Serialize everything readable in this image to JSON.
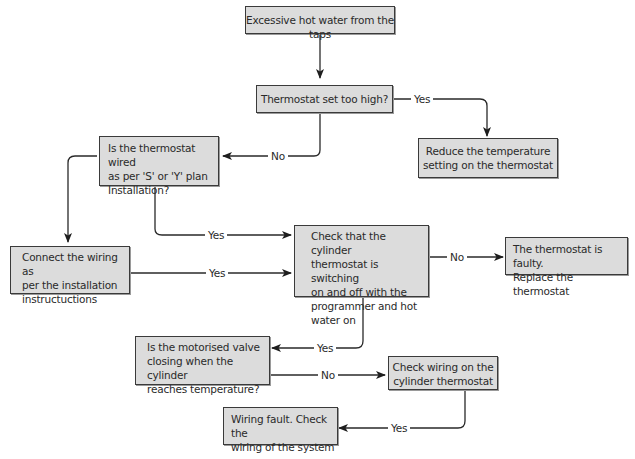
{
  "diagram": {
    "type": "flowchart",
    "nodes": {
      "start": "Excessive hot water from the taps",
      "thermostat_high": "Thermostat set too high?",
      "reduce_temp": "Reduce the temperature setting on the thermostat",
      "wired_plan": "Is the thermostat wired as per 'S' or 'Y' plan Installation?",
      "connect_wiring": "Connect the wiring as per the installation instructions",
      "check_switching": "Check that the cylinder thermostat is switching on and off with the programmer and hot water on",
      "faulty": "The thermostat is faulty. Replace the thermostat",
      "motorised_valve": "Is the motorised valve closing when the cylinder reaches temperature?",
      "check_wiring": "Check wiring on the cylinder thermostat",
      "wiring_fault": "Wiring fault. Check the wiring of the system"
    },
    "node_lines": {
      "start": [
        "Excessive hot water from the taps"
      ],
      "thermostat_high": [
        "Thermostat set too high?"
      ],
      "reduce_temp": [
        "Reduce the temperature",
        "setting on the thermostat"
      ],
      "wired_plan": [
        "Is the thermostat wired",
        "as per 'S' or 'Y' plan",
        "Installation?"
      ],
      "connect_wiring": [
        "Connect the wiring as",
        "per the installation",
        "instructuctions"
      ],
      "check_switching": [
        "Check that the cylinder",
        "thermostat is switching",
        "on and off with the",
        "programmer and hot",
        "water on"
      ],
      "faulty": [
        "The thermostat is faulty.",
        "Replace the thermostat"
      ],
      "motorised_valve": [
        "Is the motorised valve",
        "closing when the cylinder",
        "reaches temperature?"
      ],
      "check_wiring": [
        "Check wiring on the",
        "cylinder thermostat"
      ],
      "wiring_fault": [
        "Wiring fault. Check the",
        "wiring of the system"
      ]
    },
    "edges": [
      {
        "from": "start",
        "to": "thermostat_high",
        "label": ""
      },
      {
        "from": "thermostat_high",
        "to": "reduce_temp",
        "label": "Yes"
      },
      {
        "from": "thermostat_high",
        "to": "wired_plan",
        "label": "No"
      },
      {
        "from": "wired_plan",
        "to": "connect_wiring",
        "label": ""
      },
      {
        "from": "wired_plan",
        "to": "check_switching",
        "label": "Yes"
      },
      {
        "from": "connect_wiring",
        "to": "check_switching",
        "label": "Yes"
      },
      {
        "from": "check_switching",
        "to": "faulty",
        "label": "No"
      },
      {
        "from": "check_switching",
        "to": "motorised_valve",
        "label": "Yes"
      },
      {
        "from": "motorised_valve",
        "to": "check_wiring",
        "label": "No"
      },
      {
        "from": "check_wiring",
        "to": "wiring_fault",
        "label": "Yes"
      }
    ],
    "colors": {
      "node_fill": "#dcdcdc",
      "node_border": "#3a3a3a",
      "edge": "#2a2a2a"
    }
  }
}
